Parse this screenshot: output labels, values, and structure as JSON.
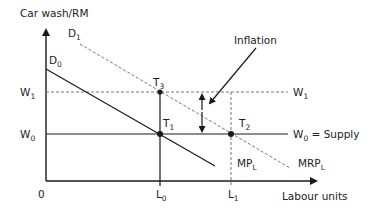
{
  "diagram": {
    "type": "labour-market-wage-diagram",
    "y_axis_label": "Car wash/RM",
    "x_axis_label": "Labour units",
    "origin_label": "0",
    "annotation": "Inflation",
    "labels": {
      "D0": {
        "main": "D",
        "sub": "0"
      },
      "D1": {
        "main": "D",
        "sub": "1"
      },
      "W1_left": {
        "main": "W",
        "sub": "1"
      },
      "W1_right": {
        "main": "W",
        "sub": "1"
      },
      "W0_left": {
        "main": "W",
        "sub": "0"
      },
      "W0_right": {
        "main": "W",
        "sub": "0",
        "suffix": " = Supply"
      },
      "T1": {
        "main": "T",
        "sub": "1"
      },
      "T2": {
        "main": "T",
        "sub": "2"
      },
      "T3": {
        "main": "T",
        "sub": "3"
      },
      "L0": {
        "main": "L",
        "sub": "0"
      },
      "L1": {
        "main": "L",
        "sub": "1"
      },
      "MPL": {
        "main": "MP",
        "sub": "L"
      },
      "MRPL": {
        "main": "MRP",
        "sub": "L"
      }
    },
    "colors": {
      "line": "#1a1a1a",
      "dashed": "#777777",
      "text": "#222222"
    }
  }
}
